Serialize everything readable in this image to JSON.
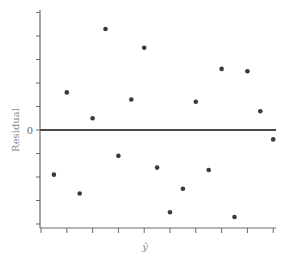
{
  "chart_data": {
    "type": "scatter",
    "title": "",
    "xlabel": "ŷ",
    "ylabel": "Residual",
    "y_tick_labels": [
      {
        "value": 0,
        "label": "0"
      }
    ],
    "x_ticks": [
      0,
      1,
      2,
      3,
      4,
      5,
      6,
      7,
      8,
      9
    ],
    "y_ticks": [
      -4,
      -3,
      -2,
      -1,
      0,
      1,
      2,
      3,
      4,
      5
    ],
    "xlim": [
      0,
      9.2
    ],
    "ylim": [
      -4.2,
      5.0
    ],
    "grid": false,
    "reference_line": {
      "y": 0
    },
    "points": [
      {
        "x": 0.5,
        "y": -1.9
      },
      {
        "x": 1.0,
        "y": 1.6
      },
      {
        "x": 1.5,
        "y": -2.7
      },
      {
        "x": 2.0,
        "y": 0.5
      },
      {
        "x": 2.5,
        "y": 4.3
      },
      {
        "x": 3.0,
        "y": -1.1
      },
      {
        "x": 3.5,
        "y": 1.3
      },
      {
        "x": 4.0,
        "y": 3.5
      },
      {
        "x": 4.5,
        "y": -1.6
      },
      {
        "x": 5.0,
        "y": -3.5
      },
      {
        "x": 5.5,
        "y": -2.5
      },
      {
        "x": 6.0,
        "y": 1.2
      },
      {
        "x": 6.5,
        "y": -1.7
      },
      {
        "x": 7.0,
        "y": 2.6
      },
      {
        "x": 7.5,
        "y": -3.7
      },
      {
        "x": 8.0,
        "y": 2.5
      },
      {
        "x": 8.5,
        "y": 0.8
      },
      {
        "x": 9.0,
        "y": -0.4
      }
    ]
  },
  "labels": {
    "ylabel": "Residual",
    "xlabel": "ŷ",
    "zero": "0"
  }
}
